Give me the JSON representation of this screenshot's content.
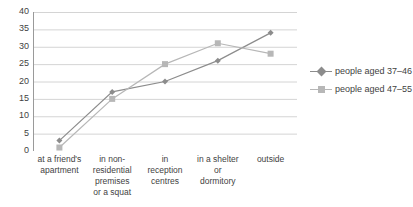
{
  "chart_data": {
    "type": "line",
    "title": "",
    "xlabel": "",
    "ylabel": "",
    "ylim": [
      0,
      40
    ],
    "ytick_step": 5,
    "yticks": [
      "40",
      "35",
      "30",
      "25",
      "20",
      "15",
      "10",
      "5",
      "0"
    ],
    "grid": true,
    "legend_position": "right",
    "categories": [
      "at a friend's\napartment",
      "in non-\nresidential\npremises\nor a squat",
      "in\nreception\ncentres",
      "in a shelter\nor\ndormitory",
      "outside"
    ],
    "category_lines": [
      [
        "at a friend's",
        "apartment"
      ],
      [
        "in non-",
        "residential",
        "premises",
        "or a squat"
      ],
      [
        "in",
        "reception",
        "centres"
      ],
      [
        "in a shelter",
        "or",
        "dormitory"
      ],
      [
        "outside"
      ]
    ],
    "series": [
      {
        "name": "people aged 37–46",
        "values": [
          3,
          17,
          20,
          26,
          34
        ],
        "color": "#8c8c8c",
        "marker": "diamond"
      },
      {
        "name": "people aged 47–55",
        "values": [
          1,
          15,
          25,
          31,
          28
        ],
        "color": "#b7b7b7",
        "marker": "square"
      }
    ]
  },
  "colors": {
    "axis": "#9a9a9a",
    "grid": "#d4d4d4",
    "text": "#3f3f3f",
    "series1": "#8c8c8c",
    "series2": "#b7b7b7"
  }
}
